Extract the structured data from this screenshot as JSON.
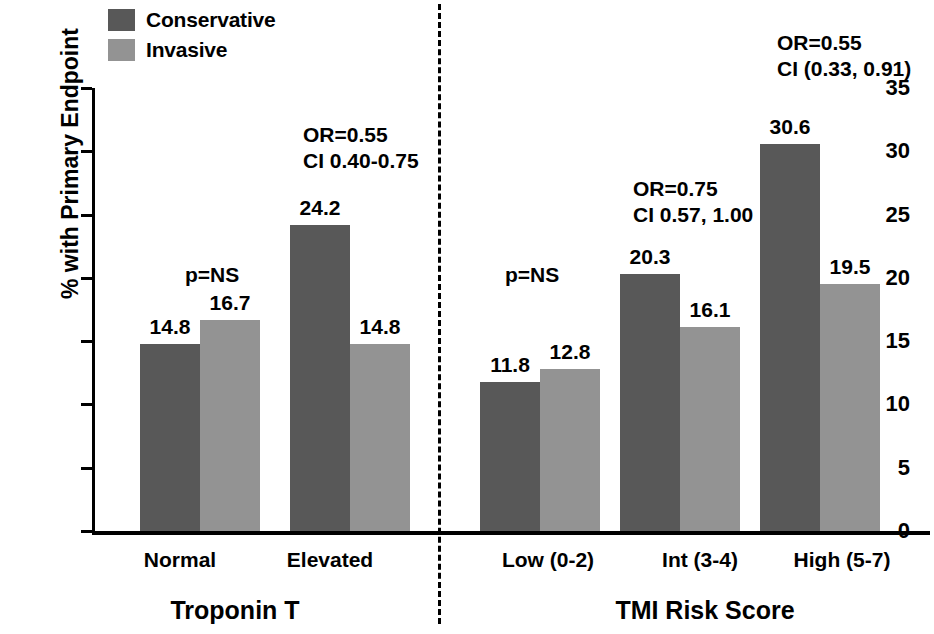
{
  "chart_data": {
    "type": "bar",
    "title": "",
    "xlabel": "",
    "ylabel": "% with Primary Endpoint",
    "ylim": [
      0,
      35
    ],
    "yticks": [
      0,
      5,
      10,
      15,
      20,
      25,
      30,
      35
    ],
    "ytick_labels": [
      "0",
      "5",
      "10",
      "15",
      "20",
      "25",
      "30",
      "35"
    ],
    "grid": false,
    "legend_position": "top-left",
    "categories": [
      "Normal",
      "Elevated",
      "Low (0-2)",
      "Int (3-4)",
      "High (5-7)"
    ],
    "series": [
      {
        "name": "Conservative",
        "color": "#585858",
        "values": [
          14.8,
          24.2,
          11.8,
          20.3,
          30.6
        ]
      },
      {
        "name": "Invasive",
        "color": "#939393",
        "values": [
          16.7,
          14.8,
          12.8,
          16.1,
          19.5
        ]
      }
    ],
    "data_labels": {
      "Conservative": [
        "14.8",
        "24.2",
        "11.8",
        "20.3",
        "30.6"
      ],
      "Invasive": [
        "16.7",
        "14.8",
        "12.8",
        "16.1",
        "19.5"
      ]
    },
    "annotations": [
      {
        "category": "Normal",
        "lines": [
          "p=NS"
        ]
      },
      {
        "category": "Elevated",
        "lines": [
          "OR=0.55",
          "CI 0.40-0.75"
        ]
      },
      {
        "category": "Low (0-2)",
        "lines": [
          "p=NS"
        ]
      },
      {
        "category": "Int (3-4)",
        "lines": [
          "OR=0.75",
          "CI 0.57, 1.00"
        ]
      },
      {
        "category": "High (5-7)",
        "lines": [
          "OR=0.55",
          "CI (0.33, 0.91)"
        ]
      }
    ],
    "panels": [
      {
        "title": "Troponin T",
        "categories": [
          "Normal",
          "Elevated"
        ]
      },
      {
        "title": "TMI Risk Score",
        "categories": [
          "Low (0-2)",
          "Int (3-4)",
          "High (5-7)"
        ]
      }
    ],
    "panel_divider": true
  },
  "legend": {
    "items": [
      {
        "label": "Conservative",
        "color": "#585858"
      },
      {
        "label": "Invasive",
        "color": "#939393"
      }
    ]
  },
  "axis": {
    "y_title": "% with Primary Endpoint",
    "y_ticks": [
      "35",
      "30",
      "25",
      "20",
      "15",
      "10",
      "5",
      "0"
    ]
  },
  "categories": [
    {
      "label": "Normal"
    },
    {
      "label": "Elevated"
    },
    {
      "label": "Low (0-2)"
    },
    {
      "label": "Int (3-4)"
    },
    {
      "label": "High (5-7)"
    }
  ],
  "values": {
    "normal_conservative": "14.8",
    "normal_invasive": "16.7",
    "elevated_conservative": "24.2",
    "elevated_invasive": "14.8",
    "low_conservative": "11.8",
    "low_invasive": "12.8",
    "int_conservative": "20.3",
    "int_invasive": "16.1",
    "high_conservative": "30.6",
    "high_invasive": "19.5"
  },
  "annotations": {
    "normal": "p=NS",
    "elevated_or": "OR=0.55",
    "elevated_ci": "CI 0.40-0.75",
    "low": "p=NS",
    "int_or": "OR=0.75",
    "int_ci": "CI 0.57, 1.00",
    "high_or": "OR=0.55",
    "high_ci": "CI (0.33, 0.91)"
  },
  "panels": {
    "left_title": "Troponin T",
    "right_title": "TMI Risk Score"
  }
}
